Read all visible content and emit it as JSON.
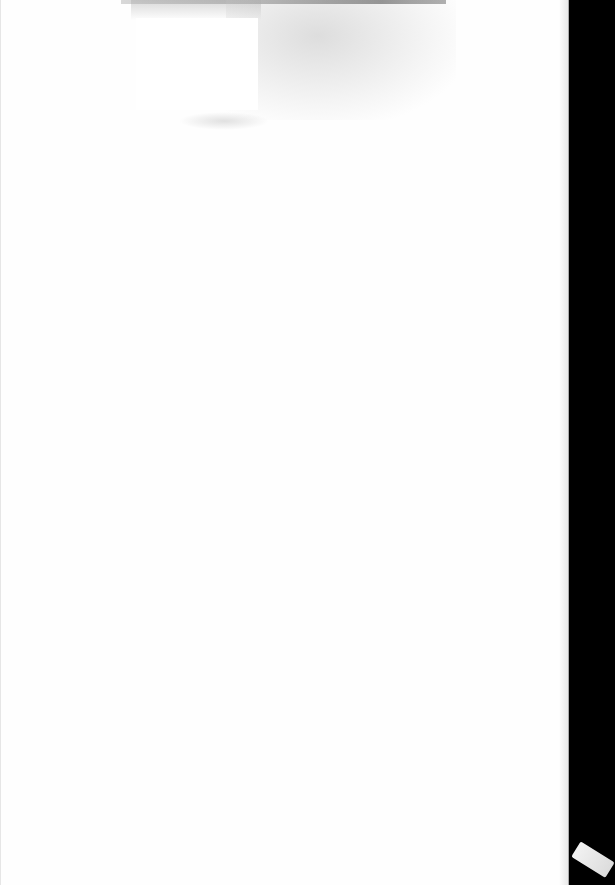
{
  "document": {
    "type": "scanned-blank-page",
    "text_content": "",
    "colors": {
      "page": "#fefefe",
      "background": "#000000",
      "bleed_through": "#a8a8a8"
    }
  }
}
